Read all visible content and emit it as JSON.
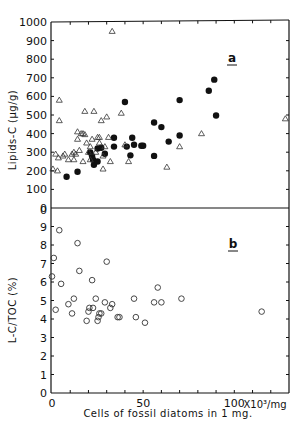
{
  "chart_data": [
    {
      "id": "a",
      "type": "scatter",
      "panel_label": "a",
      "title": "",
      "xlabel": "Cells of fossil diatoms in 1 mg.",
      "ylabel": "Lipids-C (μg/g)",
      "xlim": [
        0,
        130
      ],
      "ylim": [
        0,
        1000
      ],
      "yticks": [
        0,
        100,
        200,
        300,
        400,
        500,
        600,
        700,
        800,
        900,
        1000
      ],
      "ytick_labels": [
        "0",
        "100",
        "200",
        "300",
        "400",
        "500",
        "600",
        "700",
        "800",
        "900",
        "1000"
      ],
      "grid": false,
      "series": [
        {
          "name": "filled-circles",
          "marker": "filled-circle",
          "points": [
            [
              8,
              168
            ],
            [
              14,
              195
            ],
            [
              21,
              298
            ],
            [
              22,
              278
            ],
            [
              22.5,
              260
            ],
            [
              23,
              232
            ],
            [
              25,
              250
            ],
            [
              25,
              320
            ],
            [
              27,
              324
            ],
            [
              29,
              292
            ],
            [
              34,
              378
            ],
            [
              34,
              330
            ],
            [
              40,
              570
            ],
            [
              41,
              330
            ],
            [
              43,
              283
            ],
            [
              44,
              378
            ],
            [
              45,
              340
            ],
            [
              49,
              335
            ],
            [
              50,
              335
            ],
            [
              56,
              280
            ],
            [
              56,
              460
            ],
            [
              60,
              435
            ],
            [
              64,
              357
            ],
            [
              70,
              390
            ],
            [
              70,
              580
            ],
            [
              86,
              630
            ],
            [
              89,
              690
            ],
            [
              90,
              497
            ]
          ]
        },
        {
          "name": "open-triangles",
          "marker": "open-triangle",
          "points": [
            [
              0.5,
              210
            ],
            [
              2,
              290
            ],
            [
              3,
              200
            ],
            [
              3.5,
              270
            ],
            [
              4,
              580
            ],
            [
              4,
              470
            ],
            [
              6,
              280
            ],
            [
              7,
              290
            ],
            [
              9,
              260
            ],
            [
              11,
              290
            ],
            [
              12,
              300
            ],
            [
              12,
              260
            ],
            [
              13,
              290
            ],
            [
              14,
              410
            ],
            [
              14,
              370
            ],
            [
              15,
              310
            ],
            [
              16,
              400
            ],
            [
              17,
              400
            ],
            [
              17,
              250
            ],
            [
              18,
              395
            ],
            [
              18,
              520
            ],
            [
              19,
              350
            ],
            [
              20,
              300
            ],
            [
              21,
              260
            ],
            [
              21,
              330
            ],
            [
              22,
              370
            ],
            [
              23,
              520
            ],
            [
              24,
              300
            ],
            [
              25,
              380
            ],
            [
              26,
              350
            ],
            [
              26,
              380
            ],
            [
              27,
              470
            ],
            [
              28,
              280
            ],
            [
              28,
              210
            ],
            [
              29,
              330
            ],
            [
              30,
              490
            ],
            [
              31,
              380
            ],
            [
              32,
              250
            ],
            [
              33,
              950
            ],
            [
              38,
              510
            ],
            [
              40,
              340
            ],
            [
              42,
              250
            ],
            [
              63,
              220
            ],
            [
              70,
              330
            ],
            [
              82,
              400
            ],
            [
              128,
              480
            ]
          ]
        }
      ]
    },
    {
      "id": "b",
      "type": "scatter",
      "panel_label": "b",
      "title": "",
      "xlabel": "Cells of fossil diatoms in 1 mg.",
      "x_unit_label": "X10³/mg",
      "ylabel": "L-C/TOC (%)",
      "xlim": [
        0,
        130
      ],
      "ylim": [
        0,
        10
      ],
      "xticks": [
        0,
        50,
        100
      ],
      "xtick_labels": [
        "0",
        "50",
        "100"
      ],
      "yticks": [
        0,
        1,
        2,
        3,
        4,
        5,
        6,
        7,
        8,
        9,
        10
      ],
      "ytick_labels": [
        "0",
        "1",
        "2",
        "3",
        "4",
        "5",
        "6",
        "7",
        "8",
        "9",
        "0"
      ],
      "grid": false,
      "series": [
        {
          "name": "open-circles",
          "marker": "open-circle",
          "points": [
            [
              0,
              6.3
            ],
            [
              1,
              7.3
            ],
            [
              2,
              4.5
            ],
            [
              4,
              8.8
            ],
            [
              5,
              5.9
            ],
            [
              9,
              4.8
            ],
            [
              11,
              4.3
            ],
            [
              12,
              5.1
            ],
            [
              14,
              8.1
            ],
            [
              15,
              6.6
            ],
            [
              19,
              3.9
            ],
            [
              20,
              4.4
            ],
            [
              20.5,
              4.6
            ],
            [
              22,
              6.1
            ],
            [
              22.5,
              4.6
            ],
            [
              24,
              5.1
            ],
            [
              25,
              3.9
            ],
            [
              25.5,
              4.1
            ],
            [
              26,
              4.3
            ],
            [
              27,
              4.3
            ],
            [
              29,
              4.9
            ],
            [
              30,
              7.1
            ],
            [
              32,
              4.6
            ],
            [
              33,
              4.8
            ],
            [
              36,
              4.1
            ],
            [
              37,
              4.1
            ],
            [
              45,
              5.1
            ],
            [
              46,
              4.1
            ],
            [
              51,
              3.8
            ],
            [
              56,
              4.9
            ],
            [
              58,
              5.7
            ],
            [
              60,
              4.9
            ],
            [
              71,
              5.1
            ],
            [
              115,
              4.4
            ]
          ]
        }
      ]
    }
  ],
  "x_axis": {
    "tick_labels": [
      "0",
      "50",
      "100"
    ],
    "unit_label": "X10³/mg",
    "title": "Cells of fossil diatoms in 1 mg."
  }
}
